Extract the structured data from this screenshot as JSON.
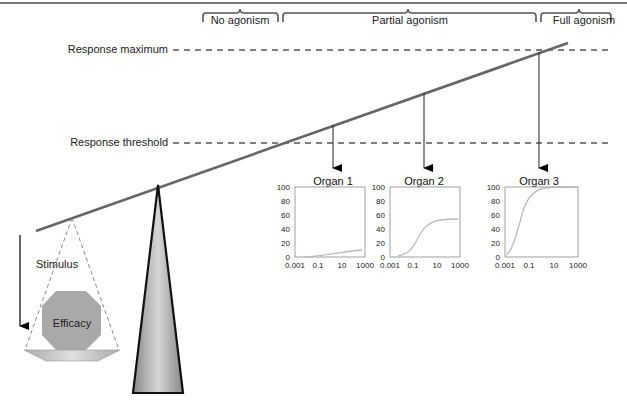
{
  "labels": {
    "response_maximum": "Response maximum",
    "response_threshold": "Response threshold",
    "stimulus": "Stimulus",
    "efficacy": "Efficacy"
  },
  "brackets": {
    "no_agonism": "No agonism",
    "partial_agonism": "Partial agonism",
    "full_agonism": "Full agonism"
  },
  "organs": [
    {
      "title": "Organ 1",
      "y_ticks": [
        "100",
        "80",
        "60",
        "40",
        "20",
        "0"
      ],
      "x_ticks": [
        "0.001",
        "0.1",
        "10",
        "1000"
      ],
      "max_response": 10
    },
    {
      "title": "Organ 2",
      "y_ticks": [
        "100",
        "80",
        "60",
        "40",
        "20",
        "0"
      ],
      "x_ticks": [
        "0.001",
        "0.1",
        "10",
        "1000"
      ],
      "max_response": 50
    },
    {
      "title": "Organ 3",
      "y_ticks": [
        "100",
        "80",
        "60",
        "40",
        "20",
        "0"
      ],
      "x_ticks": [
        "0.001",
        "0.1",
        "10",
        "1000"
      ],
      "max_response": 100
    }
  ],
  "colors": {
    "beam": "#666666",
    "dashed": "#555555",
    "curve": "#bbbbbb",
    "octagon": "#a8a8a8"
  }
}
